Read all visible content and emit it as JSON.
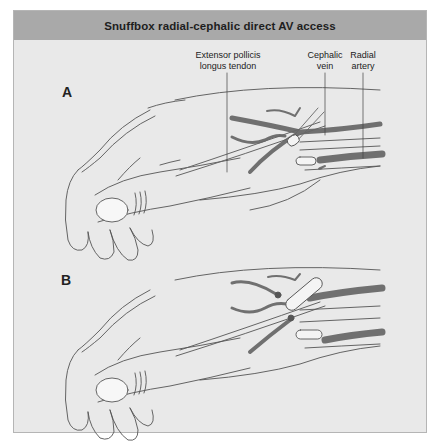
{
  "figure": {
    "title": "Snuffbox radial-cephalic direct AV access",
    "colors": {
      "header_bg": "#a9a9a9",
      "body_bg": "#e9e9e9",
      "vessel": "#6e6e6e",
      "outline": "#555555",
      "tendon_fill": "#f4f4f4"
    }
  },
  "panels": [
    {
      "letter": "A",
      "labels": {
        "tendon": "Extensor pollicis\nlongus tendon",
        "tendon_line1": "Extensor pollicis",
        "tendon_line2": "longus tendon",
        "vein_line1": "Cephalic",
        "vein_line2": "vein",
        "artery_line1": "Radial",
        "artery_line2": "artery"
      }
    },
    {
      "letter": "B"
    }
  ]
}
